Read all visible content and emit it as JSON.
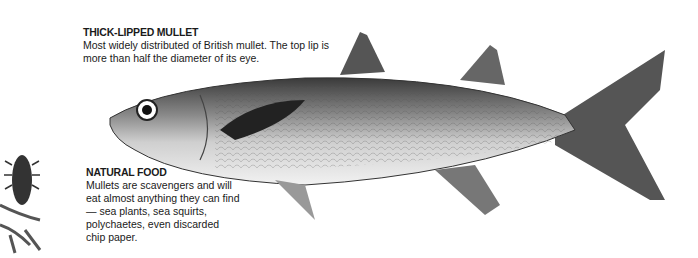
{
  "species": {
    "title": "THICK-LIPPED MULLET",
    "description_lines": [
      "Most widely distributed of British mullet. The top lip is",
      "more than half the diameter of its eye."
    ]
  },
  "food": {
    "title": "NATURAL FOOD",
    "description_lines": [
      "Mullets are scavengers and will",
      "eat almost anything they can find",
      "— sea plants, sea squirts,",
      "polychaetes, even discarded",
      "chip paper."
    ]
  },
  "illustrations": {
    "fish": "thick-lipped-mullet-illustration",
    "food": "sea-louse-on-seaweed-illustration"
  }
}
